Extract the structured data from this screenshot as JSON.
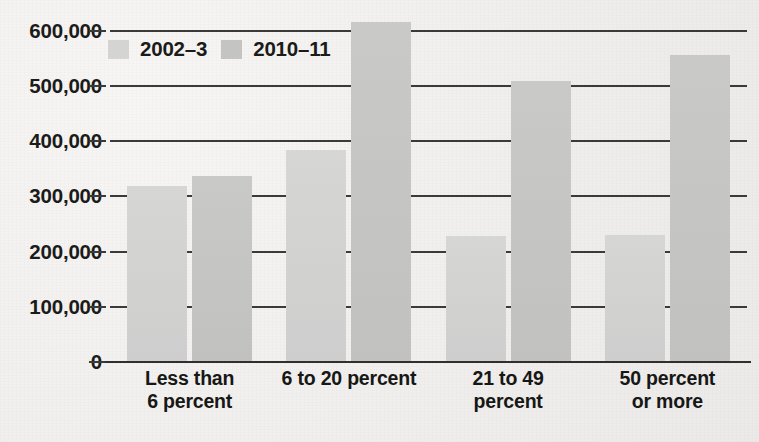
{
  "chart_data": {
    "type": "bar",
    "title": "",
    "subtitle": "",
    "xlabel": "",
    "ylabel": "",
    "ylim": [
      0,
      630000
    ],
    "grid": true,
    "legend_position": "inside top-left",
    "categories": [
      "Less than 6 percent",
      "6 to 20 percent",
      "21 to 49 percent",
      "50 percent or more"
    ],
    "category_lines": [
      [
        "Less than",
        "6 percent"
      ],
      [
        "6 to 20 percent"
      ],
      [
        "21 to 49",
        "percent"
      ],
      [
        "50 percent",
        "or more"
      ]
    ],
    "y_ticks": [
      0,
      100000,
      200000,
      300000,
      400000,
      500000,
      600000
    ],
    "y_tick_labels": [
      "0",
      "100,000",
      "200,000",
      "300,000",
      "400,000",
      "500,000",
      "600,000"
    ],
    "series": [
      {
        "name": "2002–3",
        "color": "#d4d4d2",
        "values": [
          318000,
          383000,
          228000,
          230000
        ]
      },
      {
        "name": "2010–11",
        "color": "#c4c4c2",
        "values": [
          337000,
          616000,
          509000,
          556000
        ]
      }
    ]
  },
  "legend": {
    "items": [
      {
        "label": "2002–3",
        "color": "#d4d4d2"
      },
      {
        "label": "2010–11",
        "color": "#c4c4c2"
      }
    ]
  },
  "colors": {
    "background": "#f1f0ee",
    "axis": "#2f2f2d",
    "gridline": "#3a3a38",
    "text": "#1b1b1a",
    "series_2002_3": "#d4d4d2",
    "series_2010_11": "#c4c4c2"
  }
}
